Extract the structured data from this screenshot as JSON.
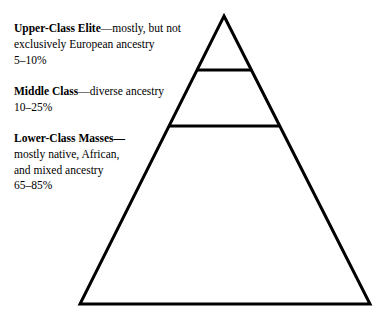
{
  "diagram": {
    "type": "pyramid",
    "background_color": "#ffffff",
    "stroke_color": "#000000",
    "stroke_width": 3,
    "geometry": {
      "apex": [
        224,
        16
      ],
      "base_left": [
        80,
        304
      ],
      "base_right": [
        370,
        304
      ],
      "divider_1_y": 70,
      "divider_2_y": 126
    },
    "tiers": [
      {
        "id": "upper-class-elite",
        "heading": "Upper-Class Elite",
        "dash": "—",
        "description_line_1": "mostly, but not",
        "description_line_2": "exclusively European ancestry",
        "percent": "5–10%",
        "share_low": 5,
        "share_high": 10
      },
      {
        "id": "middle-class",
        "heading": "Middle Class",
        "dash": "—",
        "description_line_1": "diverse ancestry",
        "description_line_2": "",
        "percent": "10–25%",
        "share_low": 10,
        "share_high": 25
      },
      {
        "id": "lower-class-masses",
        "heading": "Lower-Class Masses",
        "dash": "—",
        "description_line_1": "mostly native, African,",
        "description_line_2": "and mixed ancestry",
        "percent": "65–85%",
        "share_low": 65,
        "share_high": 85
      }
    ]
  },
  "chart_data": {
    "type": "pie",
    "categories": [
      "Upper-Class Elite",
      "Middle Class",
      "Lower-Class Masses"
    ],
    "values": [
      7.5,
      17.5,
      75
    ],
    "value_labels": [
      "5–10%",
      "10–25%",
      "65–85%"
    ],
    "xlabel": "",
    "ylabel": "Share of population (%)",
    "legend": "none",
    "grid": false
  }
}
